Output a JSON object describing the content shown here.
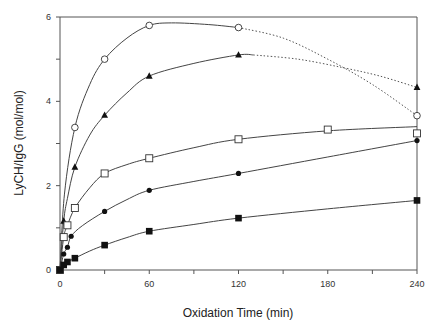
{
  "chart_data": {
    "type": "line",
    "title": "",
    "xlabel": "Oxidation Time  (min)",
    "ylabel": "LyCH/IgG  (mol/mol)",
    "xlim": [
      0,
      240
    ],
    "ylim": [
      0,
      6
    ],
    "x_ticks": [
      0,
      60,
      120,
      180,
      240
    ],
    "x_minor_ticks": [
      30,
      90,
      150,
      210
    ],
    "y_ticks": [
      0,
      2,
      4,
      6
    ],
    "y_minor_ticks": [
      1,
      3,
      5
    ],
    "grid": false,
    "legend": null,
    "series": [
      {
        "name": "open-circle",
        "marker": "open-circle",
        "x": [
          0,
          10,
          30,
          60,
          120,
          240
        ],
        "y": [
          0,
          3.38,
          5.0,
          5.8,
          5.75,
          3.66
        ],
        "curve_solid": [
          [
            0,
            0
          ],
          [
            3,
            1.8
          ],
          [
            10,
            3.38
          ],
          [
            20,
            4.4
          ],
          [
            30,
            5.0
          ],
          [
            45,
            5.5
          ],
          [
            60,
            5.8
          ],
          [
            75,
            5.86
          ],
          [
            100,
            5.82
          ],
          [
            120,
            5.75
          ]
        ],
        "curve_dotted": [
          [
            120,
            5.75
          ],
          [
            150,
            5.5
          ],
          [
            180,
            5.0
          ],
          [
            210,
            4.4
          ],
          [
            240,
            3.66
          ]
        ]
      },
      {
        "name": "filled-triangle",
        "marker": "filled-triangle",
        "x": [
          0,
          2.5,
          10,
          30,
          60,
          120,
          240
        ],
        "y": [
          0,
          1.16,
          2.44,
          3.67,
          4.6,
          5.1,
          4.33
        ],
        "curve_solid": [
          [
            0,
            0
          ],
          [
            2.5,
            1.16
          ],
          [
            5,
            1.7
          ],
          [
            10,
            2.44
          ],
          [
            20,
            3.2
          ],
          [
            30,
            3.67
          ],
          [
            45,
            4.2
          ],
          [
            60,
            4.6
          ],
          [
            90,
            4.9
          ],
          [
            120,
            5.1
          ],
          [
            130,
            5.1
          ]
        ],
        "curve_dotted": [
          [
            130,
            5.1
          ],
          [
            160,
            5.0
          ],
          [
            190,
            4.8
          ],
          [
            215,
            4.6
          ],
          [
            240,
            4.33
          ]
        ]
      },
      {
        "name": "open-square",
        "marker": "open-square",
        "x": [
          0,
          2.5,
          5,
          10,
          30,
          60,
          120,
          180,
          240
        ],
        "y": [
          0,
          0.78,
          1.06,
          1.47,
          2.29,
          2.65,
          3.1,
          3.33,
          3.24
        ],
        "curve_solid": [
          [
            0,
            0
          ],
          [
            2.5,
            0.78
          ],
          [
            5,
            1.06
          ],
          [
            10,
            1.47
          ],
          [
            20,
            1.95
          ],
          [
            30,
            2.29
          ],
          [
            45,
            2.5
          ],
          [
            60,
            2.65
          ],
          [
            90,
            2.9
          ],
          [
            120,
            3.1
          ],
          [
            180,
            3.3
          ],
          [
            240,
            3.4
          ]
        ],
        "curve_dotted": []
      },
      {
        "name": "filled-circle",
        "marker": "filled-circle",
        "x": [
          0,
          2.5,
          5,
          7.5,
          30,
          60,
          120,
          240
        ],
        "y": [
          0,
          0.38,
          0.54,
          0.8,
          1.39,
          1.89,
          2.29,
          3.07
        ],
        "curve_solid": [
          [
            0,
            0
          ],
          [
            2.5,
            0.38
          ],
          [
            5,
            0.54
          ],
          [
            7.5,
            0.8
          ],
          [
            15,
            1.05
          ],
          [
            30,
            1.39
          ],
          [
            45,
            1.67
          ],
          [
            60,
            1.89
          ],
          [
            90,
            2.1
          ],
          [
            120,
            2.29
          ],
          [
            180,
            2.68
          ],
          [
            240,
            3.07
          ]
        ],
        "curve_dotted": []
      },
      {
        "name": "filled-square",
        "marker": "filled-square",
        "x": [
          0,
          2.5,
          5,
          10,
          30,
          60,
          120,
          240
        ],
        "y": [
          0,
          0.12,
          0.19,
          0.28,
          0.59,
          0.92,
          1.23,
          1.65
        ],
        "curve_solid": [
          [
            0,
            0
          ],
          [
            2.5,
            0.12
          ],
          [
            5,
            0.19
          ],
          [
            10,
            0.28
          ],
          [
            20,
            0.45
          ],
          [
            30,
            0.59
          ],
          [
            45,
            0.77
          ],
          [
            60,
            0.92
          ],
          [
            90,
            1.08
          ],
          [
            120,
            1.23
          ],
          [
            180,
            1.45
          ],
          [
            240,
            1.65
          ]
        ],
        "curve_dotted": []
      }
    ]
  },
  "axes": {
    "x_title": "Oxidation Time  (min)",
    "y_title": "LyCH/IgG  (mol/mol)"
  }
}
